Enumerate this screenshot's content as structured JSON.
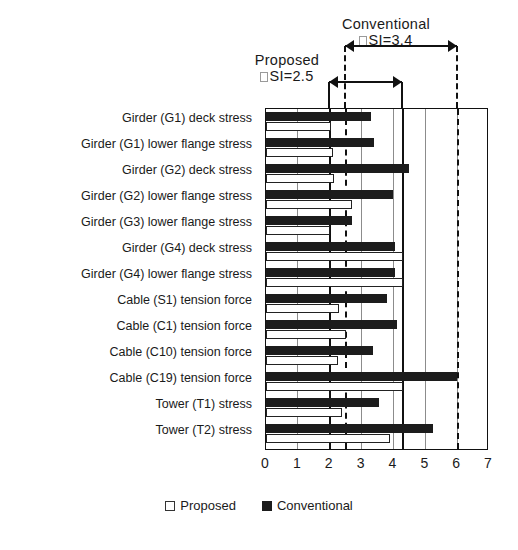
{
  "chart_data": {
    "type": "bar",
    "orientation": "horizontal",
    "title": "",
    "xlabel": "",
    "ylabel": "",
    "xlim": [
      0,
      7
    ],
    "xticks": [
      "0",
      "1",
      "2",
      "3",
      "4",
      "5",
      "6",
      "7"
    ],
    "grid": true,
    "legend_position": "bottom",
    "categories": [
      "Girder (G1) deck stress",
      "Girder (G1) lower flange stress",
      "Girder (G2) deck stress",
      "Girder (G2) lower flange stress",
      "Girder (G3) lower flange stress",
      "Girder (G4) deck stress",
      "Girder (G4) lower flange stress",
      "Cable (S1) tension force",
      "Cable (C1) tension force",
      "Cable (C10) tension force",
      "Cable (C19) tension force",
      "Tower (T1) stress",
      "Tower (T2) stress"
    ],
    "series": [
      {
        "name": "Conventional",
        "color": "#1c1c1c",
        "values": [
          3.3,
          3.4,
          4.5,
          4.0,
          2.7,
          4.05,
          4.05,
          3.8,
          4.1,
          3.35,
          6.0,
          3.55,
          5.25
        ]
      },
      {
        "name": "Proposed",
        "color": "#ffffff",
        "values": [
          2.05,
          2.1,
          2.15,
          2.7,
          2.0,
          4.3,
          4.3,
          2.3,
          2.5,
          2.25,
          4.3,
          2.4,
          3.9
        ]
      }
    ],
    "reference_lines": [
      {
        "name": "proposed-lower",
        "value": 2.0,
        "style": "solid"
      },
      {
        "name": "conventional-lower",
        "value": 2.5,
        "style": "dashed"
      },
      {
        "name": "proposed-upper",
        "value": 4.3,
        "style": "solid"
      },
      {
        "name": "conventional-upper",
        "value": 6.0,
        "style": "dashed"
      }
    ],
    "annotations": [
      {
        "id": "proposed",
        "title": "Proposed",
        "value_text": "SI=2.5",
        "missing_glyph": true,
        "span_from": 2.0,
        "span_to": 4.3
      },
      {
        "id": "conventional",
        "title": "Conventional",
        "value_text": "SI=3.4",
        "missing_glyph": true,
        "span_from": 2.5,
        "span_to": 6.0
      }
    ],
    "legend": [
      {
        "label": "Proposed",
        "marker": "open-square"
      },
      {
        "label": "Conventional",
        "marker": "filled-square"
      }
    ]
  }
}
